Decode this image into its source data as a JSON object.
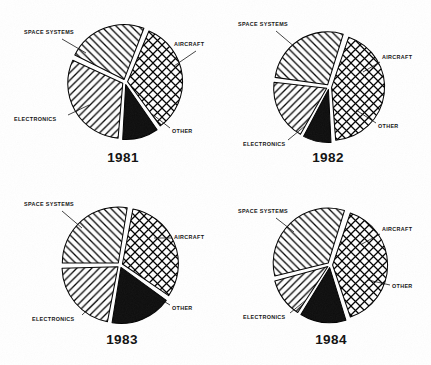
{
  "figure": {
    "kind": "four-panel-pie-figure",
    "background": "#ffffff",
    "ink": "#111111"
  },
  "segment_styles": {
    "SPACE SYSTEMS": "crosshatch",
    "AIRCRAFT": "solid-black",
    "OTHER": "diagonal-hatch-right",
    "ELECTRONICS": "diagonal-hatch-left"
  },
  "labels": {
    "space_systems": "SPACE SYSTEMS",
    "aircraft": "AIRCRAFT",
    "other": "OTHER",
    "electronics": "ELECTRONICS"
  },
  "panels": [
    {
      "id": "panel-1981",
      "year": "1981"
    },
    {
      "id": "panel-1982",
      "year": "1982"
    },
    {
      "id": "panel-1983",
      "year": "1983"
    },
    {
      "id": "panel-1984",
      "year": "1984"
    }
  ],
  "chart_data": [
    {
      "type": "pie",
      "title": "1981",
      "exploded": true,
      "start_angle_deg": -68,
      "categories": [
        "SPACE SYSTEMS",
        "AIRCRAFT",
        "OTHER",
        "ELECTRONICS"
      ],
      "values": [
        34,
        11,
        31,
        24
      ],
      "units": "percent",
      "legend": "inline-callout-labels"
    },
    {
      "type": "pie",
      "title": "1982",
      "exploded": true,
      "start_angle_deg": -72,
      "categories": [
        "SPACE SYSTEMS",
        "AIRCRAFT",
        "OTHER",
        "ELECTRONICS"
      ],
      "values": [
        44,
        9,
        19,
        28
      ],
      "units": "percent",
      "legend": "inline-callout-labels"
    },
    {
      "type": "pie",
      "title": "1983",
      "exploded": true,
      "start_angle_deg": -80,
      "categories": [
        "SPACE SYSTEMS",
        "AIRCRAFT",
        "OTHER",
        "ELECTRONICS"
      ],
      "values": [
        32,
        18,
        22,
        28
      ],
      "units": "percent",
      "legend": "inline-callout-labels"
    },
    {
      "type": "pie",
      "title": "1984",
      "exploded": true,
      "start_angle_deg": -72,
      "categories": [
        "SPACE SYSTEMS",
        "AIRCRAFT",
        "OTHER",
        "ELECTRONICS"
      ],
      "values": [
        40,
        14,
        12,
        34
      ],
      "units": "percent",
      "legend": "inline-callout-labels"
    }
  ],
  "panel_geometry": [
    {
      "cx": 125,
      "cy": 82,
      "r": 55,
      "year_x": 123,
      "year_y": 158,
      "labels": [
        {
          "key": "space_systems",
          "tx": 24,
          "ty": 33,
          "anchor": "start",
          "lx1": 62,
          "ly1": 39,
          "lx2": 86,
          "ly2": 53
        },
        {
          "key": "aircraft",
          "tx": 174,
          "ty": 45,
          "anchor": "start",
          "lx1": 196,
          "ly1": 51,
          "lx2": 174,
          "ly2": 66
        },
        {
          "key": "electronics",
          "tx": 14,
          "ty": 120,
          "anchor": "start",
          "lx1": 68,
          "ly1": 115,
          "lx2": 89,
          "ly2": 105
        },
        {
          "key": "other",
          "tx": 172,
          "ty": 132,
          "anchor": "start",
          "lx1": 170,
          "ly1": 128,
          "lx2": 152,
          "ly2": 114
        }
      ]
    },
    {
      "cx": 329,
      "cy": 87,
      "r": 53,
      "year_x": 328,
      "year_y": 158,
      "labels": [
        {
          "key": "space_systems",
          "tx": 238,
          "ty": 25,
          "anchor": "start",
          "lx1": 276,
          "ly1": 31,
          "lx2": 296,
          "ly2": 48
        },
        {
          "key": "aircraft",
          "tx": 382,
          "ty": 58,
          "anchor": "start",
          "lx1": 380,
          "ly1": 62,
          "lx2": 363,
          "ly2": 72
        },
        {
          "key": "electronics",
          "tx": 243,
          "ty": 145,
          "anchor": "start",
          "lx1": 288,
          "ly1": 140,
          "lx2": 305,
          "ly2": 126
        },
        {
          "key": "other",
          "tx": 378,
          "ty": 127,
          "anchor": "start",
          "lx1": 376,
          "ly1": 123,
          "lx2": 356,
          "ly2": 110
        }
      ]
    },
    {
      "cx": 120,
      "cy": 265,
      "r": 56,
      "year_x": 122,
      "year_y": 340,
      "labels": [
        {
          "key": "space_systems",
          "tx": 24,
          "ty": 205,
          "anchor": "start",
          "lx1": 62,
          "ly1": 211,
          "lx2": 82,
          "ly2": 228
        },
        {
          "key": "aircraft",
          "tx": 174,
          "ty": 238,
          "anchor": "start",
          "lx1": 172,
          "ly1": 238,
          "lx2": 154,
          "ly2": 238
        },
        {
          "key": "electronics",
          "tx": 32,
          "ty": 320,
          "anchor": "start",
          "lx1": 82,
          "ly1": 315,
          "lx2": 98,
          "ly2": 300
        },
        {
          "key": "other",
          "tx": 172,
          "ty": 309,
          "anchor": "start",
          "lx1": 170,
          "ly1": 305,
          "lx2": 152,
          "ly2": 294
        }
      ]
    },
    {
      "cx": 330,
      "cy": 265,
      "r": 55,
      "year_x": 331,
      "year_y": 340,
      "labels": [
        {
          "key": "space_systems",
          "tx": 238,
          "ty": 212,
          "anchor": "start",
          "lx1": 276,
          "ly1": 218,
          "lx2": 294,
          "ly2": 232
        },
        {
          "key": "aircraft",
          "tx": 382,
          "ty": 230,
          "anchor": "start",
          "lx1": 380,
          "ly1": 234,
          "lx2": 362,
          "ly2": 244
        },
        {
          "key": "electronics",
          "tx": 243,
          "ty": 318,
          "anchor": "start",
          "lx1": 290,
          "ly1": 313,
          "lx2": 306,
          "ly2": 300
        },
        {
          "key": "other",
          "tx": 392,
          "ty": 287,
          "anchor": "start",
          "lx1": 390,
          "ly1": 285,
          "lx2": 368,
          "ly2": 280
        }
      ]
    }
  ]
}
